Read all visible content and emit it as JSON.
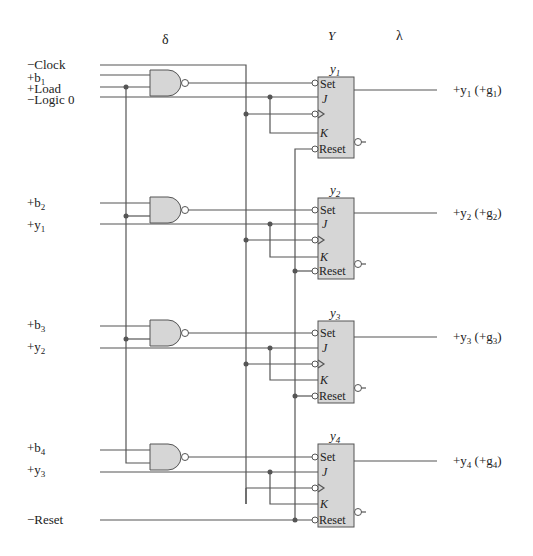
{
  "header": {
    "delta_label": "δ",
    "Y_label": "Y",
    "lambda_label": "λ"
  },
  "inputs": {
    "clock": "−Clock",
    "load": "+Load",
    "logic0": "−Logic 0",
    "reset": "−Reset"
  },
  "pins": {
    "set": "Set",
    "j": "J",
    "k": "K",
    "reset": "Reset"
  },
  "colors": {
    "wire": "#555555",
    "component_fill": "#d6d6d6",
    "junction": "#555555",
    "background": "#ffffff"
  },
  "stages": [
    {
      "index": 1,
      "ff_title": "y",
      "ff_sub": "1",
      "b_input": "+b",
      "b_sub": "1",
      "j_source": "−Logic 0",
      "output_label": "+y",
      "output_sub": "1",
      "output_paren": "(+g",
      "output_paren_sub": "1",
      "output_close": ")"
    },
    {
      "index": 2,
      "ff_title": "y",
      "ff_sub": "2",
      "b_input": "+b",
      "b_sub": "2",
      "j_input": "+y",
      "j_sub": "1",
      "output_label": "+y",
      "output_sub": "2",
      "output_paren": "(+g",
      "output_paren_sub": "2",
      "output_close": ")"
    },
    {
      "index": 3,
      "ff_title": "y",
      "ff_sub": "3",
      "b_input": "+b",
      "b_sub": "3",
      "j_input": "+y",
      "j_sub": "2",
      "output_label": "+y",
      "output_sub": "3",
      "output_paren": "(+g",
      "output_paren_sub": "3",
      "output_close": ")"
    },
    {
      "index": 4,
      "ff_title": "y",
      "ff_sub": "4",
      "b_input": "+b",
      "b_sub": "4",
      "j_input": "+y",
      "j_sub": "3",
      "output_label": "+y",
      "output_sub": "4",
      "output_paren": "(+g",
      "output_paren_sub": "4",
      "output_close": ")"
    }
  ]
}
